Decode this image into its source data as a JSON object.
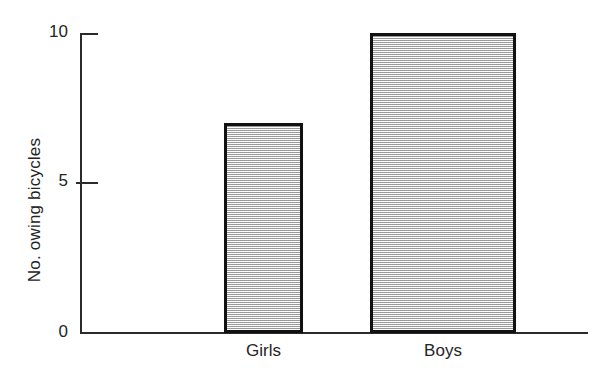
{
  "chart_data": {
    "type": "bar",
    "title": "",
    "xlabel": "",
    "ylabel": "No. owing bicycles",
    "categories": [
      "Girls",
      "Boys"
    ],
    "values": [
      7,
      10
    ],
    "ylim": [
      0,
      10
    ],
    "ytick_labels": [
      "0",
      "5",
      "10"
    ],
    "ytick_values": [
      0,
      5,
      10
    ],
    "grid": false,
    "legend": null,
    "series": [
      {
        "name": "No. owing bicycles",
        "values": [
          7,
          10
        ]
      }
    ],
    "style": {
      "bar_fill": "#d4d4d4",
      "bar_edge": "#111111",
      "axis_color": "#2b2b2b",
      "text_color": "#242424",
      "background": "#ffffff"
    }
  },
  "axis": {
    "y_title": "No. owing bicycles",
    "ticks": {
      "top": "10",
      "mid": "5",
      "bottom": "0"
    }
  },
  "bars": {
    "girls": {
      "label": "Girls",
      "value": 7
    },
    "boys": {
      "label": "Boys",
      "value": 10
    }
  }
}
